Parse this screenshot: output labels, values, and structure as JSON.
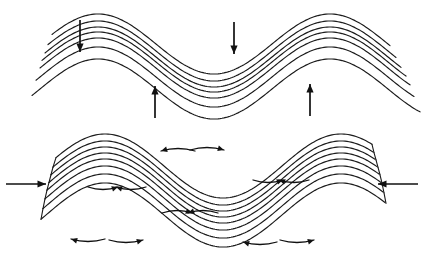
{
  "figure": {
    "background_color": "#ffffff",
    "line_color": "#1a1a1a",
    "arrow_color": "#111111",
    "width": 424,
    "height": 258,
    "panel_count": 2
  },
  "panels": [
    {
      "id": "top-panel",
      "name": "vertical-compression-fold",
      "caption": "",
      "description": "Folded multilayer sequence with vertical load arrows",
      "layer_count": 7,
      "fold_type": "sinusoidal anticline-syncline train",
      "arrows": [
        {
          "id": "down-arrow-left",
          "direction": "down",
          "label": "",
          "x": 80,
          "y_start": 20,
          "y_end": 52
        },
        {
          "id": "down-arrow-mid",
          "direction": "down",
          "label": "",
          "x": 234,
          "y_start": 22,
          "y_end": 54
        },
        {
          "id": "up-arrow-left",
          "direction": "up",
          "label": "",
          "x": 155,
          "y_start": 118,
          "y_end": 86
        },
        {
          "id": "up-arrow-right",
          "direction": "up",
          "label": "",
          "x": 310,
          "y_start": 116,
          "y_end": 84
        }
      ]
    },
    {
      "id": "bottom-panel",
      "name": "layer-parallel-shortening-fold",
      "caption": "",
      "description": "Folded multilayer sequence with horizontal compression and bedding-plane slip arrows",
      "layer_count": 8,
      "fold_type": "sinusoidal anticline-syncline train",
      "arrows": [
        {
          "id": "compress-arrow-left",
          "direction": "right",
          "label": "",
          "x_start": 6,
          "x_end": 46,
          "y": 184
        },
        {
          "id": "compress-arrow-right",
          "direction": "left",
          "label": "",
          "x_start": 418,
          "x_end": 378,
          "y": 184
        }
      ],
      "slip_arrows": [
        {
          "id": "slip-crest-left-a",
          "sense": "outward-left",
          "hinge": "anticline-crest-1"
        },
        {
          "id": "slip-crest-left-b",
          "sense": "outward-right",
          "hinge": "anticline-crest-1"
        },
        {
          "id": "slip-trough-left-a",
          "sense": "outward-left",
          "hinge": "syncline-trough-1"
        },
        {
          "id": "slip-trough-left-b",
          "sense": "outward-right",
          "hinge": "syncline-trough-1"
        },
        {
          "id": "slip-inflect-left-a",
          "sense": "inward-right",
          "hinge": "inflection-1"
        },
        {
          "id": "slip-inflect-left-b",
          "sense": "inward-left",
          "hinge": "inflection-1"
        },
        {
          "id": "slip-mid-a",
          "sense": "inward-right",
          "hinge": "syncline-crest-mid"
        },
        {
          "id": "slip-mid-b",
          "sense": "inward-left",
          "hinge": "syncline-crest-mid"
        },
        {
          "id": "slip-inflect-right-a",
          "sense": "inward-right",
          "hinge": "inflection-2"
        },
        {
          "id": "slip-inflect-right-b",
          "sense": "inward-left",
          "hinge": "inflection-2"
        },
        {
          "id": "slip-trough-right-a",
          "sense": "outward-left",
          "hinge": "syncline-trough-2"
        },
        {
          "id": "slip-trough-right-b",
          "sense": "outward-right",
          "hinge": "syncline-trough-2"
        }
      ]
    }
  ],
  "chart_data": {
    "type": "line",
    "xlabel": "",
    "ylabel": "",
    "grid": false,
    "legend": "none",
    "xlim": [
      0,
      424
    ],
    "ylim": [
      0,
      258
    ],
    "panels": [
      {
        "name": "top-panel",
        "waveform": "sine",
        "amplitude": 30,
        "wavelength": 232,
        "phase_x": 40,
        "baseline_y": 68,
        "tilt_per_px": 0.0,
        "layer_offsets": [
          -24,
          -17,
          -11,
          -6,
          0,
          9,
          21
        ],
        "layer_count": 7
      },
      {
        "name": "bottom-panel",
        "waveform": "sine",
        "amplitude": 32,
        "wavelength": 236,
        "phase_x": 46,
        "baseline_y": 196,
        "tilt_per_px": 0.0,
        "layer_offsets": [
          -30,
          -23,
          -17,
          -11,
          -5,
          2,
          10,
          19
        ],
        "layer_count": 8
      }
    ]
  }
}
